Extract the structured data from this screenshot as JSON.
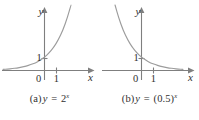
{
  "figure": {
    "panels": [
      {
        "id": "a",
        "caption_label": "(a)",
        "caption_lhs": "y",
        "caption_eq": "=",
        "caption_base": "2",
        "caption_exponent": "x",
        "caption_full": "(a) y = 2^x",
        "axis_x_label": "x",
        "axis_y_label": "y",
        "origin_label": "0",
        "x_tick_label": "1",
        "y_tick_label": "1"
      },
      {
        "id": "b",
        "caption_label": "(b)",
        "caption_lhs": "y",
        "caption_eq": "=",
        "caption_base": "(0.5)",
        "caption_exponent": "x",
        "caption_full": "(b) y = (0.5)^x",
        "axis_x_label": "x",
        "axis_y_label": "y",
        "origin_label": "0",
        "x_tick_label": "1",
        "y_tick_label": "1"
      }
    ]
  },
  "colors": {
    "curve": "#9c9c9c",
    "axis": "#7f7f7f",
    "text": "#30302f",
    "background": "#ffffff"
  },
  "chart_data": [
    {
      "type": "line",
      "title": "(a) y = 2^x",
      "function": "y = 2^x",
      "base": 2,
      "xlabel": "x",
      "ylabel": "y",
      "xlim": [
        -3.6,
        2.6
      ],
      "ylim": [
        -0.35,
        5.2
      ],
      "grid": false,
      "legend": null,
      "x_ticks": [
        0,
        1
      ],
      "x_tick_labels": [
        "0",
        "1"
      ],
      "y_ticks": [
        1
      ],
      "y_tick_labels": [
        "1"
      ],
      "y_intercept": 1,
      "asymptote": "y = 0",
      "behavior": "increasing",
      "x": [
        -3.6,
        -3.2,
        -2.8,
        -2.4,
        -2.0,
        -1.6,
        -1.2,
        -0.8,
        -0.4,
        0,
        0.4,
        0.8,
        1.2,
        1.6,
        2.0,
        2.3
      ],
      "values": [
        0.082,
        0.109,
        0.144,
        0.189,
        0.25,
        0.33,
        0.435,
        0.574,
        0.758,
        1.0,
        1.32,
        1.741,
        2.297,
        3.031,
        4.0,
        4.925
      ]
    },
    {
      "type": "line",
      "title": "(b) y = (0.5)^x",
      "function": "y = (0.5)^x",
      "base": 0.5,
      "xlabel": "x",
      "ylabel": "y",
      "xlim": [
        -2.6,
        3.6
      ],
      "ylim": [
        -0.35,
        5.2
      ],
      "grid": false,
      "legend": null,
      "x_ticks": [
        0,
        1
      ],
      "x_tick_labels": [
        "0",
        "1"
      ],
      "y_ticks": [
        1
      ],
      "y_tick_labels": [
        "1"
      ],
      "y_intercept": 1,
      "asymptote": "y = 0",
      "behavior": "decreasing",
      "x": [
        -2.3,
        -2.0,
        -1.6,
        -1.2,
        -0.8,
        -0.4,
        0,
        0.4,
        0.8,
        1.2,
        1.6,
        2.0,
        2.4,
        2.8,
        3.2,
        3.6
      ],
      "values": [
        4.925,
        4.0,
        3.031,
        2.297,
        1.741,
        1.32,
        1.0,
        0.758,
        0.574,
        0.435,
        0.33,
        0.25,
        0.189,
        0.144,
        0.109,
        0.082
      ]
    }
  ]
}
